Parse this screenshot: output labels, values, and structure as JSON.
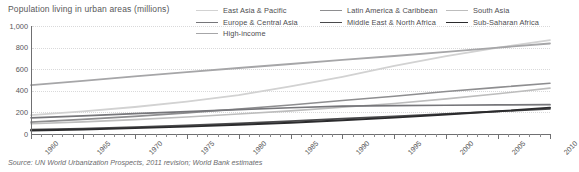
{
  "chart_data": {
    "type": "line",
    "title": "Population living in urban areas (millions)",
    "xlabel": "",
    "ylabel": "",
    "xlim": [
      1960,
      2010
    ],
    "ylim": [
      0,
      1000
    ],
    "grid": true,
    "legend_position": "top-right",
    "source": "Source: UN World Urbanization Prospects, 2011 revision; World Bank estimates",
    "x": [
      1960,
      1965,
      1970,
      1975,
      1980,
      1985,
      1990,
      1995,
      2000,
      2005,
      2010
    ],
    "ytick_labels": [
      "0",
      "200",
      "400",
      "600",
      "800",
      "1,000"
    ],
    "ytick_values": [
      0,
      200,
      400,
      600,
      800,
      1000
    ],
    "xtick_labels": [
      "1960",
      "1965",
      "1970",
      "1975",
      "1980",
      "1985",
      "1990",
      "1995",
      "2000",
      "2005",
      "2010"
    ],
    "series": [
      {
        "name": "East Asia & Pacific",
        "color": "#d2d2d2",
        "width": 1.8,
        "values": [
          175,
          210,
          250,
          300,
          360,
          440,
          530,
          630,
          720,
          800,
          870
        ]
      },
      {
        "name": "Latin America & Caribbean",
        "color": "#8e8e90",
        "width": 1.6,
        "values": [
          110,
          135,
          163,
          196,
          232,
          268,
          310,
          350,
          393,
          432,
          470
        ]
      },
      {
        "name": "South Asia",
        "color": "#bdbdbd",
        "width": 1.6,
        "values": [
          95,
          112,
          133,
          158,
          185,
          214,
          247,
          283,
          325,
          372,
          425
        ]
      },
      {
        "name": "Europe & Central Asia",
        "color": "#76767a",
        "width": 1.7,
        "values": [
          150,
          168,
          188,
          207,
          226,
          243,
          258,
          263,
          266,
          269,
          272
        ]
      },
      {
        "name": "Middle East & North Africa",
        "color": "#4a4a4c",
        "width": 1.7,
        "values": [
          40,
          50,
          63,
          79,
          98,
          119,
          142,
          164,
          187,
          210,
          232
        ]
      },
      {
        "name": "Sub-Saharan Africa",
        "color": "#2b2b2d",
        "width": 1.9,
        "values": [
          33,
          42,
          54,
          68,
          85,
          104,
          127,
          152,
          180,
          210,
          244
        ]
      },
      {
        "name": "High-income",
        "color": "#a6a6a8",
        "width": 1.8,
        "values": [
          452,
          492,
          533,
          572,
          611,
          648,
          686,
          722,
          760,
          800,
          838
        ]
      }
    ],
    "legend_rows": [
      [
        "East Asia & Pacific",
        "Latin America & Caribbean",
        "South Asia"
      ],
      [
        "Europe & Central Asia",
        "Middle East & North Africa",
        "Sub-Saharan Africa"
      ],
      [
        "High-income"
      ]
    ]
  }
}
